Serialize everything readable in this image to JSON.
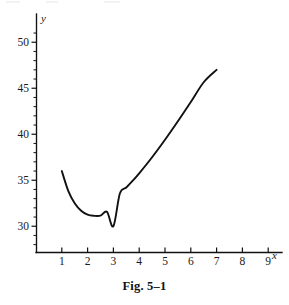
{
  "caption": "Fig. 5–1",
  "axes": {
    "x_label": "x",
    "y_label": "y",
    "x_ticks": [
      "1",
      "2",
      "3",
      "4",
      "5",
      "6",
      "7",
      "8",
      "9"
    ],
    "y_ticks": [
      "50",
      "45",
      "40",
      "35",
      "30"
    ]
  },
  "chart_data": {
    "type": "line",
    "title": "Fig. 5–1",
    "xlabel": "x",
    "ylabel": "y",
    "xlim": [
      0,
      10
    ],
    "ylim": [
      27,
      52
    ],
    "grid": false,
    "legend": null,
    "x_tick_values": [
      1,
      2,
      3,
      4,
      5,
      6,
      7,
      8,
      9
    ],
    "y_tick_values": [
      30,
      35,
      40,
      45,
      50
    ],
    "minor_tick_step": 1,
    "line_color": "#111111",
    "series": [
      {
        "name": "y = x + 27/x",
        "x": [
          1.0,
          1.25,
          1.5,
          1.75,
          2.0,
          2.25,
          2.5,
          2.75,
          3.0,
          3.25,
          3.5,
          3.75,
          4.0,
          4.5,
          5.0,
          5.5,
          6.0,
          6.5,
          7.0
        ],
        "y": [
          36.0,
          33.85,
          32.5,
          31.68,
          31.25,
          31.13,
          31.15,
          31.57,
          30.0,
          33.56,
          34.21,
          34.95,
          35.75,
          37.5,
          39.4,
          41.41,
          43.5,
          45.65,
          47.0
        ]
      }
    ],
    "annotations": [
      {
        "label": "start point",
        "x": 1,
        "y": 36
      },
      {
        "label": "minimum",
        "x": 3,
        "y": 30
      },
      {
        "label": "end point",
        "x": 7,
        "y": 47
      }
    ]
  },
  "geometry": {
    "origin_x_px": 36,
    "axis_y_px": 252,
    "x_unit_px": 25.8,
    "y_value_at_axis": 27.2,
    "y_unit_px": 9.2
  }
}
